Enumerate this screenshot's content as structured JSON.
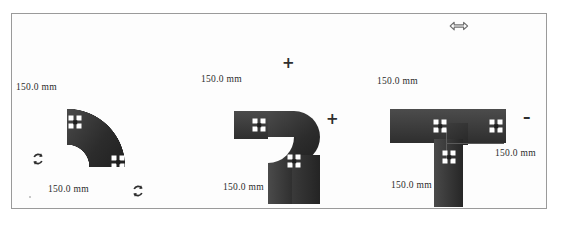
{
  "panel": {
    "name": "pipe-fitting-palette",
    "background_color": "#fdfdfd",
    "border_color": "#9a9a9a"
  },
  "controls": {
    "move_handle": {
      "icon": "left-right-arrow-icon",
      "glyph": "⟷"
    },
    "rotate_left": {
      "icon": "rotate-icon",
      "glyph": "↻"
    },
    "rotate_right": {
      "icon": "rotate-icon",
      "glyph": "↻"
    },
    "add_first": {
      "icon": "plus-icon",
      "glyph": "+"
    },
    "add_second": {
      "icon": "plus-icon",
      "glyph": "+"
    },
    "subtract": {
      "icon": "minus-icon",
      "glyph": "–"
    }
  },
  "fittings": [
    {
      "name": "curved-elbow-fitting",
      "type": "quarter-bend",
      "color": "#3a3a3a",
      "labels": [
        {
          "id": "curved-elbow-label-top",
          "text": "150.0 mm"
        },
        {
          "id": "curved-elbow-label-bottom",
          "text": "150.0 mm"
        }
      ],
      "connection_points": 2
    },
    {
      "name": "right-angle-elbow-fitting",
      "type": "90-degree-elbow",
      "color": "#343434",
      "labels": [
        {
          "id": "elbow-label-top",
          "text": "150.0 mm"
        },
        {
          "id": "elbow-label-bottom",
          "text": "150.0 mm"
        }
      ],
      "connection_points": 2
    },
    {
      "name": "tee-junction-fitting",
      "type": "tee",
      "color": "#343434",
      "labels": [
        {
          "id": "tee-label-top",
          "text": "150.0 mm"
        },
        {
          "id": "tee-label-bottom",
          "text": "150.0 mm"
        },
        {
          "id": "tee-label-right",
          "text": "150.0 mm"
        }
      ],
      "connection_points": 3
    }
  ],
  "dimension_labels": {
    "curved_top": "150.0 mm",
    "curved_bottom": "150.0 mm",
    "elbow_top": "150.0 mm",
    "elbow_bottom": "150.0 mm",
    "tee_top": "150.0 mm",
    "tee_bottom": "150.0 mm",
    "tee_right": "150.0 mm"
  }
}
